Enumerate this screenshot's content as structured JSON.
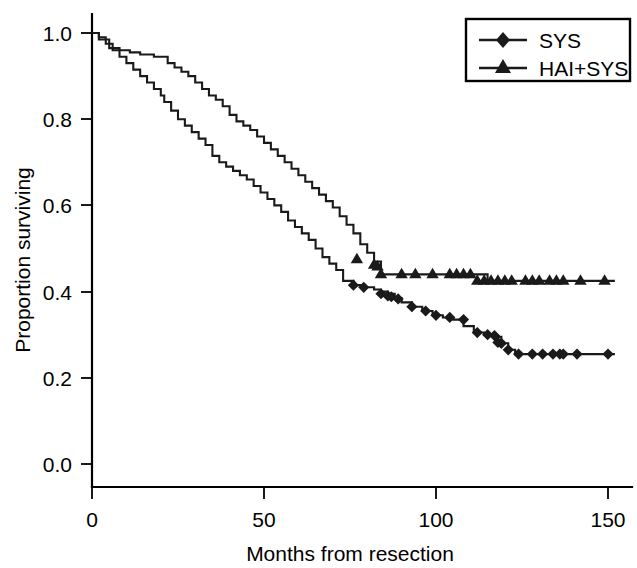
{
  "chart_data": {
    "type": "line",
    "subtype": "kaplan-meier-survival",
    "title": "",
    "xlabel": "Months from resection",
    "ylabel": "Proportion surviving",
    "xlim": [
      0,
      160
    ],
    "ylim": [
      0.0,
      1.05
    ],
    "xticks": [
      0,
      50,
      100,
      150
    ],
    "xtick_labels": [
      "0",
      "50",
      "100",
      "150"
    ],
    "yticks": [
      0.0,
      0.2,
      0.4,
      0.6,
      0.8,
      1.0
    ],
    "ytick_labels": [
      "0.0",
      "0.2",
      "0.4",
      "0.6",
      "0.8",
      "1.0"
    ],
    "grid": false,
    "legend_position": "top-right",
    "series": [
      {
        "name": "SYS",
        "marker": "diamond",
        "color": "#1a1a1a",
        "step_x": [
          0,
          2,
          4,
          6,
          8,
          10,
          12,
          14,
          16,
          18,
          20,
          21,
          23,
          25,
          27,
          29,
          31,
          33,
          35,
          37,
          39,
          41,
          43,
          45,
          47,
          49,
          51,
          53,
          55,
          57,
          59,
          61,
          63,
          65,
          67,
          69,
          71,
          73,
          76,
          79,
          82,
          84,
          86,
          88,
          90,
          93,
          96,
          99,
          102,
          105,
          108,
          111,
          114,
          117,
          119,
          121,
          123,
          152
        ],
        "step_y": [
          1.0,
          0.99,
          0.975,
          0.96,
          0.945,
          0.93,
          0.915,
          0.9,
          0.885,
          0.87,
          0.855,
          0.84,
          0.82,
          0.8,
          0.785,
          0.77,
          0.755,
          0.74,
          0.715,
          0.7,
          0.69,
          0.68,
          0.67,
          0.66,
          0.645,
          0.63,
          0.615,
          0.6,
          0.585,
          0.565,
          0.55,
          0.535,
          0.52,
          0.5,
          0.48,
          0.465,
          0.45,
          0.425,
          0.415,
          0.41,
          0.405,
          0.4,
          0.395,
          0.385,
          0.375,
          0.365,
          0.355,
          0.345,
          0.34,
          0.335,
          0.32,
          0.305,
          0.3,
          0.295,
          0.28,
          0.265,
          0.255,
          0.255
        ],
        "censor_x": [
          76,
          79,
          84,
          86,
          87,
          89,
          93,
          97,
          100,
          104,
          108,
          112,
          115,
          117,
          118,
          119,
          121,
          124,
          128,
          131,
          134,
          136,
          137,
          141,
          150
        ],
        "censor_y": [
          0.415,
          0.41,
          0.395,
          0.39,
          0.388,
          0.383,
          0.365,
          0.355,
          0.345,
          0.34,
          0.335,
          0.305,
          0.3,
          0.298,
          0.282,
          0.28,
          0.265,
          0.255,
          0.255,
          0.255,
          0.255,
          0.255,
          0.255,
          0.255,
          0.255
        ],
        "plateau_value": 0.255
      },
      {
        "name": "HAI+SYS",
        "marker": "triangle",
        "color": "#1a1a1a",
        "step_x": [
          0,
          2,
          5,
          8,
          11,
          14,
          18,
          22,
          24,
          26,
          28,
          30,
          32,
          34,
          36,
          38,
          40,
          42,
          44,
          46,
          48,
          50,
          52,
          54,
          56,
          58,
          60,
          62,
          64,
          66,
          68,
          70,
          72,
          74,
          76,
          78,
          80,
          82,
          84,
          113,
          115,
          152
        ],
        "step_y": [
          1.0,
          0.985,
          0.965,
          0.96,
          0.955,
          0.95,
          0.945,
          0.93,
          0.92,
          0.91,
          0.9,
          0.885,
          0.87,
          0.855,
          0.845,
          0.83,
          0.81,
          0.795,
          0.785,
          0.775,
          0.76,
          0.745,
          0.73,
          0.715,
          0.7,
          0.685,
          0.67,
          0.655,
          0.64,
          0.625,
          0.61,
          0.595,
          0.575,
          0.555,
          0.535,
          0.51,
          0.49,
          0.47,
          0.44,
          0.44,
          0.425,
          0.425
        ],
        "censor_x": [
          77,
          82,
          83,
          84,
          90,
          94,
          99,
          104,
          106,
          108,
          110,
          112,
          114,
          116,
          118,
          120,
          122,
          126,
          128,
          130,
          133,
          135,
          137,
          142,
          149
        ],
        "censor_y": [
          0.475,
          0.462,
          0.458,
          0.44,
          0.44,
          0.44,
          0.44,
          0.44,
          0.44,
          0.44,
          0.44,
          0.425,
          0.425,
          0.425,
          0.425,
          0.425,
          0.425,
          0.425,
          0.425,
          0.425,
          0.425,
          0.425,
          0.425,
          0.425,
          0.425
        ],
        "plateau_value": 0.425
      }
    ]
  },
  "legend": {
    "entries": [
      {
        "label": "SYS",
        "marker": "diamond"
      },
      {
        "label": "HAI+SYS",
        "marker": "triangle"
      }
    ]
  },
  "axes": {
    "x_title": "Months from resection",
    "y_title": "Proportion surviving",
    "x_tick_0": "0",
    "x_tick_1": "50",
    "x_tick_2": "100",
    "x_tick_3": "150",
    "y_tick_0": "0.0",
    "y_tick_1": "0.2",
    "y_tick_2": "0.4",
    "y_tick_3": "0.6",
    "y_tick_4": "0.8",
    "y_tick_5": "1.0"
  },
  "colors": {
    "curve": "#1a1a1a",
    "axis": "#000000",
    "background": "#ffffff"
  }
}
